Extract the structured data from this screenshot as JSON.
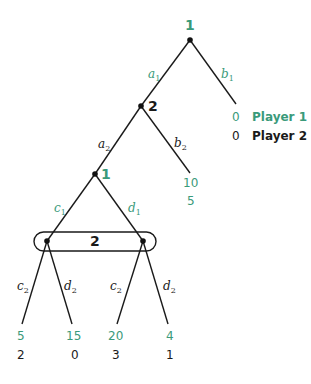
{
  "colors": {
    "player1": "#3a9a7a",
    "player2": "#1a1a1a"
  },
  "nodes": {
    "root": {
      "player": "1"
    },
    "n2": {
      "player": "2"
    },
    "n3": {
      "player": "1"
    },
    "info_set": {
      "player": "2"
    }
  },
  "actions": {
    "a1": {
      "base": "a",
      "sub": "1"
    },
    "b1": {
      "base": "b",
      "sub": "1"
    },
    "a2": {
      "base": "a",
      "sub": "2"
    },
    "b2": {
      "base": "b",
      "sub": "2"
    },
    "c1": {
      "base": "c",
      "sub": "1"
    },
    "d1": {
      "base": "d",
      "sub": "1"
    },
    "c2_left": {
      "base": "c",
      "sub": "2"
    },
    "d2_left": {
      "base": "d",
      "sub": "2"
    },
    "c2_right": {
      "base": "c",
      "sub": "2"
    },
    "d2_right": {
      "base": "d",
      "sub": "2"
    }
  },
  "legend": {
    "player1": {
      "payoff": "0",
      "label": "Player 1"
    },
    "player2": {
      "payoff": "0",
      "label": "Player 2"
    }
  },
  "payoffs": {
    "b2_leaf": {
      "p1": "10",
      "p2": "5"
    },
    "leaf1": {
      "p1": "5",
      "p2": "2"
    },
    "leaf2": {
      "p1": "15",
      "p2": "0"
    },
    "leaf3": {
      "p1": "20",
      "p2": "3"
    },
    "leaf4": {
      "p1": "4",
      "p2": "1"
    }
  }
}
